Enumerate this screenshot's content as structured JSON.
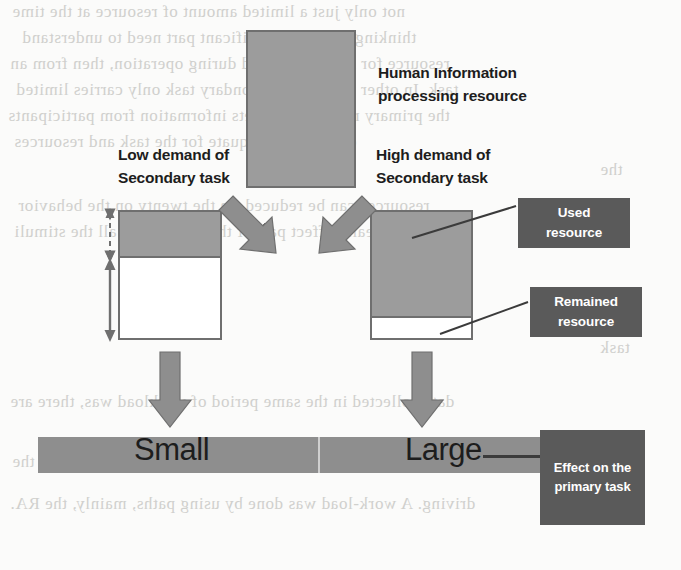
{
  "figure": {
    "title_box_label": "Human Information\nprocessing resource",
    "title_box_line1": "Human Information",
    "title_box_line2": "processing resource",
    "left_condition_line1": "Low demand of",
    "left_condition_line2": "Secondary task",
    "right_condition_line1": "High demand of",
    "right_condition_line2": "Secondary task",
    "legend": {
      "used_line1": "Used",
      "used_line2": "resource",
      "remained_line1": "Remained",
      "remained_line2": "resource"
    },
    "outcome_bar": {
      "left_label": "Small",
      "right_label": "Large"
    },
    "outcome_box_line1": "Effect on the",
    "outcome_box_line2": "primary task"
  },
  "colors": {
    "resource_gray": "#9c9c9c",
    "box_outline": "#6f6f6f",
    "callout_dark": "#5a5a5a",
    "bar_gray": "#8e8e8e",
    "arrow_gray": "#8e8e8e",
    "text_dark": "#1d1d1d",
    "page_background": "#fbfbfa"
  },
  "proportions": {
    "low_demand_used_fraction": 0.37,
    "low_demand_remained_fraction": 0.63,
    "high_demand_used_fraction": 0.83,
    "high_demand_remained_fraction": 0.17
  },
  "background_text": {
    "note": "faint show-through text from the reverse of the scanned page",
    "lines": [
      "not only just a limited amount of resource at the time",
      "thinking, so that a significant part need to understand",
      "resource for it to be devoted during operation, then from an",
      "task. In other words, the secondary task only carries limited",
      "the primary resource and gets information from participants",
      "only is not adequate for the task and resources",
      "the",
      "resources can be reduced. In the twenty on the behavior",
      "really affect part of the main to the all the stimuli",
      "task",
      "data collected in the same period of workload was, there are",
      "effect on the part of the secondary task and the",
      "driving. A work-load was done by using paths, mainly, the RA."
    ]
  }
}
